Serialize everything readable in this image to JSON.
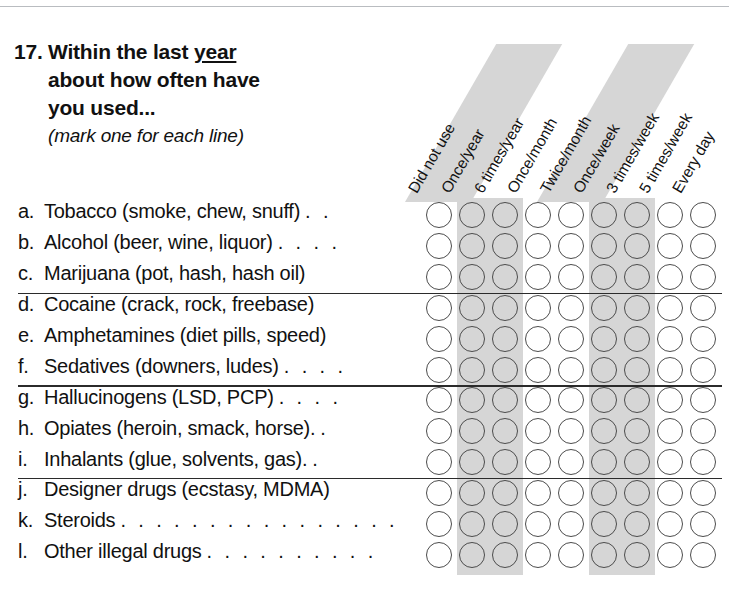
{
  "question": {
    "number": "17.",
    "line1_prefix": "Within the last ",
    "line1_underlined": "year",
    "line2": "about how often have",
    "line3": "you used...",
    "instruction": "(mark one for each line)"
  },
  "columns": [
    {
      "label": "Did not use",
      "shaded": false
    },
    {
      "label": "Once/year",
      "shaded": true
    },
    {
      "label": "6 times/year",
      "shaded": true
    },
    {
      "label": "Once/month",
      "shaded": false
    },
    {
      "label": "Twice/month",
      "shaded": false
    },
    {
      "label": "Once/week",
      "shaded": true
    },
    {
      "label": "3 times/week",
      "shaded": true
    },
    {
      "label": "5 times/week",
      "shaded": false
    },
    {
      "label": "Every day",
      "shaded": false
    }
  ],
  "rows": [
    {
      "letter": "a.",
      "text": "Tobacco (smoke, chew, snuff)",
      "leader": ". ."
    },
    {
      "letter": "b.",
      "text": "Alcohol (beer, wine, liquor)",
      "leader": ". . . ."
    },
    {
      "letter": "c.",
      "text": "Marijuana (pot, hash, hash oil)",
      "leader": ""
    },
    {
      "letter": "d.",
      "text": "Cocaine (crack, rock, freebase)",
      "leader": ""
    },
    {
      "letter": "e.",
      "text": "Amphetamines (diet pills, speed)",
      "leader": ""
    },
    {
      "letter": "f.",
      "text": "Sedatives (downers, ludes)",
      "leader": ". . . ."
    },
    {
      "letter": "g.",
      "text": "Hallucinogens (LSD, PCP)",
      "leader": ". . . ."
    },
    {
      "letter": "h.",
      "text": "Opiates (heroin, smack, horse).",
      "leader": "."
    },
    {
      "letter": "i.",
      "text": "Inhalants (glue, solvents, gas).",
      "leader": "."
    },
    {
      "letter": "j.",
      "text": "Designer drugs (ecstasy, MDMA)",
      "leader": ""
    },
    {
      "letter": "k.",
      "text": "Steroids",
      "leader": ". . . . . . . . . . . . . . . ."
    },
    {
      "letter": "l.",
      "text": "Other illegal drugs",
      "leader": ". . . . . . . . . ."
    }
  ],
  "group_breaks_after_row": [
    3,
    6,
    9
  ],
  "colors": {
    "stripe": "#d6d6d6",
    "bubble_outline": "#4c4c4c",
    "rule": "#2b2b2b",
    "text": "#111111",
    "page_border": "#b9bcc0"
  },
  "grid": {
    "columns": 9,
    "rows": 12,
    "bubble_diameter_px": 26,
    "column_pitch_px": 33,
    "row_pitch_px": 30.9,
    "first_bubble_x_px": 426,
    "first_bubble_y_px": 202
  }
}
